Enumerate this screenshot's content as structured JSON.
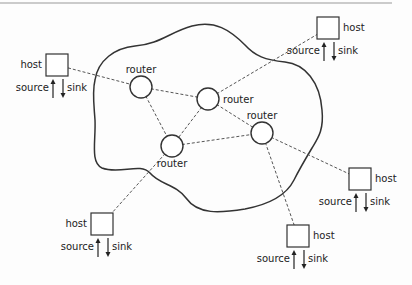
{
  "diagram": {
    "type": "network",
    "cloud": {
      "stroke": "#333333"
    },
    "routers": [
      {
        "id": "r1",
        "label": "router",
        "cx": 141,
        "cy": 87,
        "label_pos": "above"
      },
      {
        "id": "r2",
        "label": "router",
        "cx": 208,
        "cy": 99,
        "label_pos": "right"
      },
      {
        "id": "r3",
        "label": "router",
        "cx": 262,
        "cy": 133,
        "label_pos": "above"
      },
      {
        "id": "r4",
        "label": "router",
        "cx": 172,
        "cy": 146,
        "label_pos": "below"
      }
    ],
    "hosts": [
      {
        "id": "h1",
        "label": "host",
        "source_label": "source",
        "sink_label": "sink",
        "x": 46,
        "y": 54,
        "label_side": "left"
      },
      {
        "id": "h2",
        "label": "host",
        "source_label": "source",
        "sink_label": "sink",
        "x": 317,
        "y": 17,
        "label_side": "right"
      },
      {
        "id": "h3",
        "label": "host",
        "source_label": "source",
        "sink_label": "sink",
        "x": 91,
        "y": 213,
        "label_side": "left"
      },
      {
        "id": "h4",
        "label": "host",
        "source_label": "source",
        "sink_label": "sink",
        "x": 349,
        "y": 168,
        "label_side": "right"
      },
      {
        "id": "h5",
        "label": "host",
        "source_label": "source",
        "sink_label": "sink",
        "x": 287,
        "y": 225,
        "label_side": "right"
      }
    ],
    "links": [
      [
        "h1",
        "r1"
      ],
      [
        "r1",
        "r2"
      ],
      [
        "r1",
        "r4"
      ],
      [
        "r2",
        "r4"
      ],
      [
        "r2",
        "r3"
      ],
      [
        "r4",
        "r3"
      ],
      [
        "r2",
        "h2"
      ],
      [
        "r4",
        "h3"
      ],
      [
        "r3",
        "h4"
      ],
      [
        "r3",
        "h5"
      ]
    ]
  }
}
